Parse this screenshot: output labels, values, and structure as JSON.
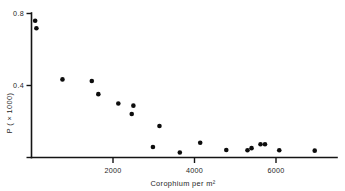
{
  "chart_data": {
    "type": "scatter",
    "title": "",
    "subtitle": "",
    "xlabel": "Corophium per m²",
    "ylabel": "P ( × 1000)",
    "xlim": [
      0,
      7500
    ],
    "ylim": [
      0,
      0.82
    ],
    "grid": false,
    "legend": null,
    "x_ticks": [
      2000,
      4000,
      6000
    ],
    "x_tick_labels": [
      "2000",
      "4000",
      "6000"
    ],
    "y_ticks": [
      0.4,
      0.8
    ],
    "y_tick_labels": [
      "0.4",
      "0.8"
    ],
    "marker": "filled-circle",
    "marker_color": "#0d0d0d",
    "axis_color": "#141414",
    "background_color": "#ffffff",
    "points": [
      {
        "x": 90,
        "y": 0.76
      },
      {
        "x": 120,
        "y": 0.718
      },
      {
        "x": 760,
        "y": 0.434
      },
      {
        "x": 1480,
        "y": 0.425
      },
      {
        "x": 1640,
        "y": 0.352
      },
      {
        "x": 2130,
        "y": 0.3
      },
      {
        "x": 2500,
        "y": 0.288
      },
      {
        "x": 2460,
        "y": 0.242
      },
      {
        "x": 3140,
        "y": 0.175
      },
      {
        "x": 2980,
        "y": 0.058
      },
      {
        "x": 3640,
        "y": 0.028
      },
      {
        "x": 4140,
        "y": 0.082
      },
      {
        "x": 4780,
        "y": 0.042
      },
      {
        "x": 5300,
        "y": 0.04
      },
      {
        "x": 5400,
        "y": 0.052
      },
      {
        "x": 5620,
        "y": 0.074
      },
      {
        "x": 5730,
        "y": 0.074
      },
      {
        "x": 6080,
        "y": 0.04
      },
      {
        "x": 6950,
        "y": 0.038
      }
    ],
    "n_points": 19
  },
  "axes": {
    "y_axis_label": "P ( × 1000)",
    "x_axis_label": "Corophium per m²",
    "y_tick_top": "0.8",
    "y_tick_mid": "0.4",
    "x_tick_1": "2000",
    "x_tick_2": "4000",
    "x_tick_3": "6000"
  }
}
